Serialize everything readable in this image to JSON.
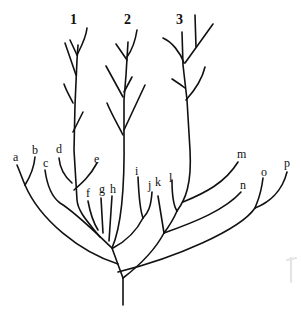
{
  "diagram": {
    "type": "branching tree / phylogenetic diagram",
    "stroke_color": "#111111",
    "background": "#ffffff",
    "tree_labels": [
      "1",
      "2",
      "3"
    ],
    "leaf_labels": [
      "a",
      "b",
      "c",
      "d",
      "e",
      "f",
      "g",
      "h",
      "i",
      "j",
      "k",
      "l",
      "m",
      "n",
      "o",
      "p"
    ]
  }
}
